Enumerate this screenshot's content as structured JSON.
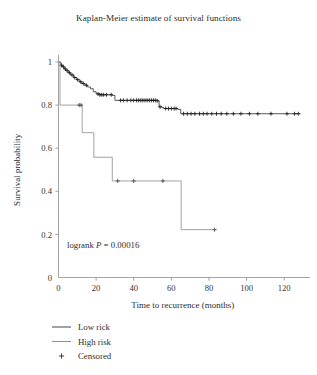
{
  "chart_data": {
    "type": "line",
    "title": "Kaplan-Meier estimate of survival functions",
    "xlabel": "Time to recurrence (months)",
    "ylabel": "Survival probability",
    "xlim": [
      0,
      130
    ],
    "ylim": [
      0,
      1.05
    ],
    "grid": false,
    "legend_position": "below-axes-left",
    "annotation": {
      "prefix": "logrank ",
      "italic_symbol": "P",
      "suffix": " = 0.00016",
      "full_text": "logrank P = 0.00016",
      "x": 5,
      "y": 0.13
    },
    "xticks": [
      0,
      20,
      40,
      60,
      80,
      100,
      120
    ],
    "xtick_labels": [
      "0",
      "20",
      "40",
      "60",
      "80",
      "100",
      "120"
    ],
    "yticks": [
      0,
      0.2,
      0.4,
      0.6,
      0.8,
      1
    ],
    "ytick_labels": [
      "0",
      "0.2",
      "0.4",
      "0.6",
      "0.8",
      "1"
    ],
    "series": [
      {
        "name": "Low rick",
        "color": "#3c3c3c",
        "steps": [
          [
            0,
            1.0
          ],
          [
            1.2,
            0.985
          ],
          [
            2.1,
            0.978
          ],
          [
            3.0,
            0.968
          ],
          [
            4.0,
            0.96
          ],
          [
            5.2,
            0.95
          ],
          [
            6.5,
            0.94
          ],
          [
            8.0,
            0.928
          ],
          [
            9.5,
            0.918
          ],
          [
            11.0,
            0.908
          ],
          [
            12.5,
            0.9
          ],
          [
            14.0,
            0.892
          ],
          [
            15.5,
            0.884
          ],
          [
            17.0,
            0.876
          ],
          [
            18.5,
            0.862
          ],
          [
            20.0,
            0.852
          ],
          [
            22.0,
            0.848
          ],
          [
            28.5,
            0.845
          ],
          [
            30.0,
            0.822
          ],
          [
            52.5,
            0.82
          ],
          [
            53.5,
            0.792
          ],
          [
            55.0,
            0.788
          ],
          [
            56.0,
            0.784
          ],
          [
            63.5,
            0.78
          ],
          [
            65.0,
            0.76
          ],
          [
            128.5,
            0.76
          ]
        ],
        "censored": [
          1.6,
          2.6,
          3.6,
          4.6,
          5.8,
          7.2,
          8.6,
          10.2,
          11.8,
          13.2,
          14.8,
          21.0,
          22.0,
          23.0,
          24.0,
          25.5,
          28.0,
          33.0,
          34.5,
          36.5,
          38.5,
          40.0,
          41.5,
          42.5,
          43.5,
          44.5,
          45.5,
          46.5,
          47.5,
          48.5,
          49.5,
          50.5,
          51.5,
          52.5,
          54.0,
          57.0,
          58.5,
          60.0,
          61.5,
          62.5,
          66.5,
          68.5,
          70.5,
          72.5,
          75.0,
          77.0,
          79.0,
          81.5,
          84.0,
          86.5,
          89.5,
          93.0,
          97.0,
          101.5,
          106.0,
          113.0,
          121.5,
          125.5,
          127.5
        ]
      },
      {
        "name": "High risk",
        "color": "#8a8a8a",
        "steps": [
          [
            0,
            1.0
          ],
          [
            0.8,
            0.8
          ],
          [
            12.0,
            0.8
          ],
          [
            12.6,
            0.672
          ],
          [
            18.2,
            0.672
          ],
          [
            18.8,
            0.558
          ],
          [
            28.0,
            0.558
          ],
          [
            28.6,
            0.448
          ],
          [
            64.5,
            0.448
          ],
          [
            65.2,
            0.222
          ],
          [
            83.5,
            0.222
          ]
        ],
        "censored": [
          11.0,
          12.0,
          31.5,
          40.0,
          55.5,
          83.0
        ]
      }
    ],
    "legend": [
      {
        "label": "Low rick",
        "marker": "line",
        "color": "#3c3c3c"
      },
      {
        "label": "High risk",
        "marker": "line",
        "color": "#8a8a8a"
      },
      {
        "label": "Censored",
        "marker": "plus",
        "color": "#3a3a3a"
      }
    ]
  },
  "figure": {
    "title": "Kaplan-Meier estimate of survival functions",
    "xlabel": "Time to recurrence (months)",
    "ylabel": "Survival probability",
    "annotation": "logrank P = 0.00016",
    "annotation_prefix": "logrank ",
    "annotation_symbol": "P",
    "annotation_suffix": " = 0.00016",
    "xtick_labels": [
      "0",
      "20",
      "40",
      "60",
      "80",
      "100",
      "120"
    ],
    "ytick_labels": [
      "0",
      "0.2",
      "0.4",
      "0.6",
      "0.8",
      "1"
    ],
    "legend_labels": [
      "Low rick",
      "High risk",
      "Censored"
    ],
    "censored_marker": "+",
    "axis_color": "#9a9a9a",
    "low_risk_color": "#3c3c3c",
    "high_risk_color": "#8a8a8a"
  }
}
